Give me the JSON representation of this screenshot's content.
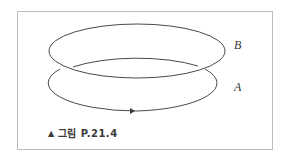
{
  "figure": {
    "caption_marker": "▲",
    "caption": "그림 P.21.4",
    "labels": {
      "loop_b": "B",
      "loop_a": "A"
    },
    "colors": {
      "stroke": "#4a4a4a",
      "frame_border": "#bdbdbd",
      "caption_text": "#3a3a3a"
    },
    "loops": [
      {
        "name": "B",
        "cx": 137,
        "cy": 51,
        "rx": 88,
        "ry": 27
      },
      {
        "name": "A",
        "cx": 137,
        "cy": 83,
        "rx": 88,
        "ry": 28,
        "arrow_direction": "right (at bottom)"
      }
    ]
  }
}
